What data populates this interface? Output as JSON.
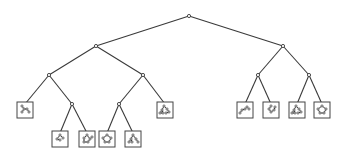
{
  "diagram": {
    "type": "binary-tree",
    "colors": {
      "edge": "#3a3a3a",
      "box": "#444444",
      "background": "#ffffff"
    },
    "nodes": [
      {
        "id": "root",
        "x": 189,
        "y": 16,
        "kind": "internal"
      },
      {
        "id": "L",
        "x": 96,
        "y": 46,
        "kind": "internal"
      },
      {
        "id": "R",
        "x": 283,
        "y": 46,
        "kind": "internal"
      },
      {
        "id": "LL",
        "x": 49,
        "y": 75,
        "kind": "internal"
      },
      {
        "id": "LR",
        "x": 143,
        "y": 75,
        "kind": "internal"
      },
      {
        "id": "RL",
        "x": 258,
        "y": 75,
        "kind": "internal"
      },
      {
        "id": "RR",
        "x": 309,
        "y": 75,
        "kind": "internal"
      },
      {
        "id": "LLa",
        "x": 25,
        "y": 110,
        "kind": "leaf",
        "glyph": "chain-zigzag"
      },
      {
        "id": "LLb",
        "x": 72,
        "y": 104,
        "kind": "internal"
      },
      {
        "id": "LRa",
        "x": 119,
        "y": 104,
        "kind": "internal"
      },
      {
        "id": "LRb",
        "x": 165,
        "y": 110,
        "kind": "leaf",
        "glyph": "branched-ring"
      },
      {
        "id": "LLb1",
        "x": 60,
        "y": 139,
        "kind": "leaf",
        "glyph": "small-branch"
      },
      {
        "id": "LLb2",
        "x": 87,
        "y": 139,
        "kind": "leaf",
        "glyph": "ring-with-tail"
      },
      {
        "id": "LRa1",
        "x": 107,
        "y": 139,
        "kind": "leaf",
        "glyph": "ring"
      },
      {
        "id": "LRa2",
        "x": 133,
        "y": 139,
        "kind": "leaf",
        "glyph": "branched-chain"
      },
      {
        "id": "RLa",
        "x": 245,
        "y": 110,
        "kind": "leaf",
        "glyph": "long-chain"
      },
      {
        "id": "RLb",
        "x": 271,
        "y": 110,
        "kind": "leaf",
        "glyph": "hook"
      },
      {
        "id": "RRa",
        "x": 297,
        "y": 110,
        "kind": "leaf",
        "glyph": "branched-ring"
      },
      {
        "id": "RRb",
        "x": 322,
        "y": 110,
        "kind": "leaf",
        "glyph": "ring"
      }
    ],
    "edges": [
      [
        "root",
        "L"
      ],
      [
        "root",
        "R"
      ],
      [
        "L",
        "LL"
      ],
      [
        "L",
        "LR"
      ],
      [
        "R",
        "RL"
      ],
      [
        "R",
        "RR"
      ],
      [
        "LL",
        "LLa"
      ],
      [
        "LL",
        "LLb"
      ],
      [
        "LR",
        "LRa"
      ],
      [
        "LR",
        "LRb"
      ],
      [
        "LLb",
        "LLb1"
      ],
      [
        "LLb",
        "LLb2"
      ],
      [
        "LRa",
        "LRa1"
      ],
      [
        "LRa",
        "LRa2"
      ],
      [
        "RL",
        "RLa"
      ],
      [
        "RL",
        "RLb"
      ],
      [
        "RR",
        "RRa"
      ],
      [
        "RR",
        "RRb"
      ]
    ],
    "leaf_box_size": 16
  }
}
